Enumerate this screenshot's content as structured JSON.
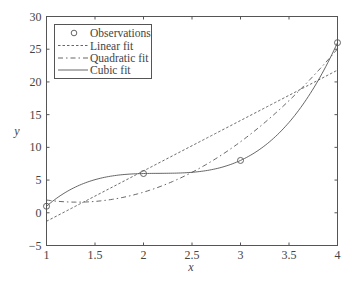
{
  "chart_data": {
    "type": "line",
    "title": "",
    "xlabel": "x",
    "ylabel": "y",
    "xlim": [
      1,
      4
    ],
    "ylim": [
      -5,
      30
    ],
    "xticks": [
      1,
      1.5,
      2,
      2.5,
      3,
      3.5,
      4
    ],
    "xtick_labels": [
      "1",
      "1.5",
      "2",
      "2.5",
      "3",
      "3.5",
      "4"
    ],
    "yticks": [
      -5,
      0,
      5,
      10,
      15,
      20,
      25,
      30
    ],
    "ytick_labels": [
      "−5",
      "0",
      "5",
      "10",
      "15",
      "20",
      "25",
      "30"
    ],
    "grid": false,
    "legend_position": "upper left",
    "observations": {
      "x": [
        1,
        2,
        3,
        4
      ],
      "y": [
        1,
        6,
        8,
        26
      ]
    },
    "series": [
      {
        "name": "Observations",
        "style": "circle-markers",
        "x": [
          1,
          2,
          3,
          4
        ],
        "y": [
          1,
          6,
          8,
          26
        ]
      },
      {
        "name": "Linear fit",
        "style": "dashed",
        "equation": "y = 7.7x - 9",
        "x": [
          1,
          4
        ],
        "y": [
          -1.3,
          21.8
        ]
      },
      {
        "name": "Quadratic fit",
        "style": "dash-dot",
        "equation": "y = 6.1875 + 7.7(x-2.5) + 3.25(x-2.5)^2",
        "x": [
          1,
          1.32,
          2,
          3,
          4
        ],
        "y": [
          1.95,
          1.63,
          3.14,
          10.85,
          24.06
        ]
      },
      {
        "name": "Cubic fit",
        "style": "solid",
        "equation": "interpolating cubic through observations",
        "x": [
          1,
          2,
          3,
          4
        ],
        "y": [
          1,
          6,
          8,
          26
        ]
      }
    ]
  },
  "legend": {
    "items": [
      {
        "label": "Observations"
      },
      {
        "label": "Linear fit"
      },
      {
        "label": "Quadratic fit"
      },
      {
        "label": "Cubic fit"
      }
    ]
  },
  "colors": {
    "axis": "#555555",
    "line": "#555555",
    "text": "#444444"
  }
}
